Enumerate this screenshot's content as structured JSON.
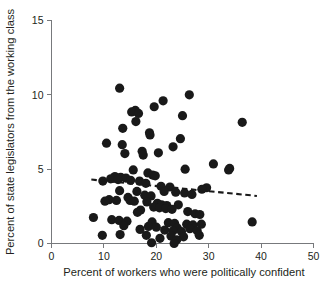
{
  "chart_data": {
    "type": "scatter",
    "title": "",
    "xlabel": "Percent of workers who were politically confident",
    "ylabel": "Percent of state legislators from the working class",
    "xlim": [
      0,
      50
    ],
    "ylim": [
      0,
      15
    ],
    "xticks": [
      0,
      10,
      20,
      30,
      40,
      50
    ],
    "yticks": [
      0,
      5,
      10,
      15
    ],
    "xtick_labels": [
      "0",
      "10",
      "20",
      "30",
      "40",
      "50"
    ],
    "ytick_labels": [
      "0",
      "5",
      "10",
      "15"
    ],
    "grid": false,
    "legend": null,
    "marker_color": "#191919",
    "marker_size": 4.6,
    "axis_color": "#77797c",
    "points": [
      [
        13.0,
        10.45
      ],
      [
        26.3,
        10.0
      ],
      [
        21.3,
        9.6
      ],
      [
        19.6,
        9.2
      ],
      [
        16.0,
        8.95
      ],
      [
        15.3,
        8.85
      ],
      [
        16.6,
        8.75
      ],
      [
        25.0,
        8.6
      ],
      [
        16.1,
        8.2
      ],
      [
        36.4,
        8.15
      ],
      [
        13.6,
        7.75
      ],
      [
        18.7,
        7.45
      ],
      [
        18.8,
        7.3
      ],
      [
        24.6,
        7.05
      ],
      [
        10.5,
        6.75
      ],
      [
        13.5,
        6.65
      ],
      [
        23.2,
        6.5
      ],
      [
        17.3,
        6.2
      ],
      [
        20.4,
        6.1
      ],
      [
        14.0,
        6.05
      ],
      [
        17.5,
        5.95
      ],
      [
        30.9,
        5.35
      ],
      [
        34.0,
        5.05
      ],
      [
        33.8,
        4.95
      ],
      [
        25.5,
        5.0
      ],
      [
        15.6,
        4.95
      ],
      [
        18.4,
        4.75
      ],
      [
        19.3,
        4.6
      ],
      [
        19.8,
        4.55
      ],
      [
        12.1,
        4.5
      ],
      [
        13.2,
        4.45
      ],
      [
        14.2,
        4.4
      ],
      [
        11.3,
        4.35
      ],
      [
        12.7,
        4.3
      ],
      [
        15.1,
        4.25
      ],
      [
        16.8,
        4.2
      ],
      [
        9.8,
        4.2
      ],
      [
        18.0,
        4.05
      ],
      [
        20.9,
        3.85
      ],
      [
        22.6,
        3.8
      ],
      [
        29.6,
        3.75
      ],
      [
        28.7,
        3.65
      ],
      [
        13.0,
        3.55
      ],
      [
        16.3,
        3.5
      ],
      [
        21.5,
        3.5
      ],
      [
        23.7,
        3.45
      ],
      [
        25.4,
        3.4
      ],
      [
        26.8,
        3.3
      ],
      [
        17.8,
        3.25
      ],
      [
        19.0,
        3.2
      ],
      [
        14.6,
        3.1
      ],
      [
        11.0,
        2.95
      ],
      [
        12.4,
        2.9
      ],
      [
        15.0,
        2.9
      ],
      [
        15.8,
        2.85
      ],
      [
        18.2,
        2.8
      ],
      [
        20.2,
        2.7
      ],
      [
        21.0,
        2.6
      ],
      [
        22.0,
        2.55
      ],
      [
        24.2,
        2.6
      ],
      [
        10.2,
        2.85
      ],
      [
        19.5,
        2.45
      ],
      [
        20.6,
        2.4
      ],
      [
        21.8,
        2.35
      ],
      [
        23.0,
        2.3
      ],
      [
        17.0,
        2.25
      ],
      [
        16.4,
        2.1
      ],
      [
        26.0,
        2.15
      ],
      [
        27.4,
        2.0
      ],
      [
        28.3,
        1.95
      ],
      [
        38.3,
        1.45
      ],
      [
        8.0,
        1.75
      ],
      [
        11.5,
        1.6
      ],
      [
        12.9,
        1.55
      ],
      [
        14.4,
        1.5
      ],
      [
        19.2,
        1.45
      ],
      [
        22.3,
        1.4
      ],
      [
        23.5,
        1.35
      ],
      [
        25.8,
        1.3
      ],
      [
        27.0,
        1.25
      ],
      [
        28.6,
        1.3
      ],
      [
        13.8,
        1.2
      ],
      [
        18.5,
        1.15
      ],
      [
        20.0,
        1.1
      ],
      [
        24.0,
        1.05
      ],
      [
        26.4,
        1.0
      ],
      [
        16.9,
        0.95
      ],
      [
        21.6,
        0.9
      ],
      [
        23.2,
        0.85
      ],
      [
        24.8,
        0.8
      ],
      [
        27.8,
        0.85
      ],
      [
        9.7,
        0.55
      ],
      [
        13.1,
        0.6
      ],
      [
        18.1,
        0.55
      ],
      [
        22.8,
        0.5
      ],
      [
        25.2,
        0.45
      ],
      [
        28.2,
        0.55
      ],
      [
        20.7,
        0.35
      ],
      [
        23.9,
        0.25
      ],
      [
        19.1,
        0.05
      ],
      [
        23.4,
        0.0
      ]
    ],
    "trend_line": {
      "style": "dashed",
      "x_start": 7.6,
      "y_start": 4.3,
      "x_end": 39.2,
      "y_end": 3.2
    }
  }
}
